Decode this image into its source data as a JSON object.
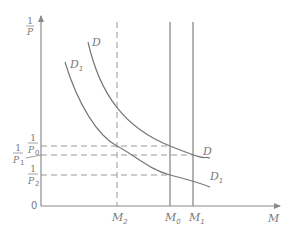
{
  "diagram": {
    "y_axis": {
      "label_numerator": "1",
      "label_denominator": "P"
    },
    "x_axis": {
      "label": "M"
    },
    "origin_label": "0",
    "curves": [
      {
        "id": "D",
        "label": "D",
        "subscript": ""
      },
      {
        "id": "D1",
        "label": "D",
        "subscript": "1"
      }
    ],
    "curve_top_labels": [
      {
        "label": "D",
        "subscript": ""
      },
      {
        "label": "D",
        "subscript": "1"
      }
    ],
    "y_levels": [
      {
        "id": "P0",
        "numerator": "1",
        "denominator": "P",
        "subscript": "0"
      },
      {
        "id": "P1",
        "numerator": "1",
        "denominator": "P",
        "subscript": "1"
      },
      {
        "id": "P2",
        "numerator": "1",
        "denominator": "P",
        "subscript": "2"
      }
    ],
    "x_levels": [
      {
        "id": "M2",
        "label": "M",
        "subscript": "2",
        "style": "dashed"
      },
      {
        "id": "M0",
        "label": "M",
        "subscript": "0",
        "style": "solid"
      },
      {
        "id": "M1",
        "label": "M",
        "subscript": "1",
        "style": "solid"
      }
    ],
    "colors": {
      "lines": "#8a8a8a",
      "text": "#7a7a7a",
      "background": "#ffffff"
    }
  }
}
